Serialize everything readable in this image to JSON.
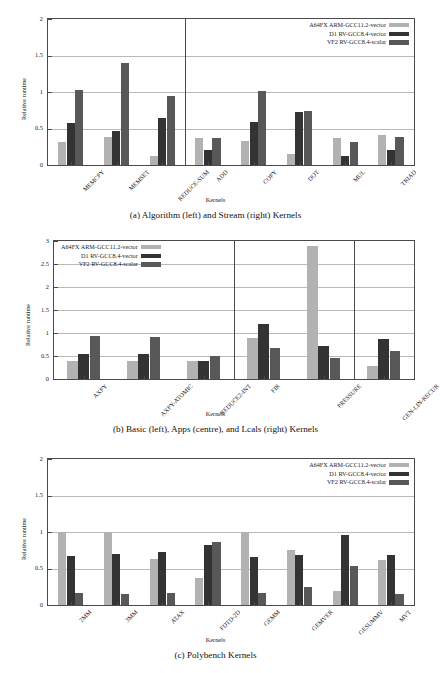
{
  "series_colors": {
    "a64fx": "#b2b2b2",
    "d1": "#333333",
    "vf2": "#585858"
  },
  "legend": {
    "items": [
      {
        "label": "A64FX ARM-GCC11.2-vector",
        "key": "a64fx"
      },
      {
        "label": "D1 RV-GCC8.4-vector",
        "key": "d1"
      },
      {
        "label": "VF2 RV-GCC8.4-scalar",
        "key": "vf2"
      }
    ]
  },
  "axis": {
    "ylabel": "Relative runtime",
    "xlabel": "Kernels"
  },
  "captions": {
    "a": "(a) Algorithm (left) and Stream (right) Kernels",
    "b": "(b) Basic (left), Apps (centre), and Lcals (right) Kernels",
    "c": "(c) Polybench Kernels"
  },
  "chart_data": [
    {
      "id": "a",
      "type": "bar",
      "title": "(a) Algorithm (left) and Stream (right) Kernels",
      "xlabel": "Kernels",
      "ylabel": "Relative runtime",
      "ylim": [
        0,
        2
      ],
      "yticks": [
        0,
        0.5,
        1,
        1.5,
        2
      ],
      "ytick_labels": [
        "0",
        "0.5",
        "1",
        "1.5",
        "2"
      ],
      "grid": true,
      "legend_position": "top-right",
      "group_dividers_after": [
        "REDUCE-SUM"
      ],
      "categories": [
        "MEMCPY",
        "MEMSET",
        "REDUCE-SUM",
        "ADD",
        "COPY",
        "DOT",
        "MUL",
        "TRIAD"
      ],
      "series": [
        {
          "name": "A64FX ARM-GCC11.2-vector",
          "values": [
            0.32,
            0.38,
            0.13,
            0.37,
            0.33,
            0.15,
            0.37,
            0.41
          ]
        },
        {
          "name": "D1 RV-GCC8.4-vector",
          "values": [
            0.58,
            0.47,
            0.65,
            0.21,
            0.59,
            0.72,
            0.13,
            0.21
          ]
        },
        {
          "name": "VF2 RV-GCC8.4-scalar",
          "values": [
            1.03,
            1.4,
            0.95,
            0.37,
            1.02,
            0.74,
            0.31,
            0.39
          ]
        }
      ]
    },
    {
      "id": "b",
      "type": "bar",
      "title": "(b) Basic (left), Apps (centre), and Lcals (right) Kernels",
      "xlabel": "Kernels",
      "ylabel": "Relative runtime",
      "ylim": [
        0,
        3
      ],
      "yticks": [
        0,
        0.5,
        1,
        1.5,
        2,
        2.5,
        3
      ],
      "ytick_labels": [
        "0",
        "0.5",
        "1",
        "1.5",
        "2",
        "2.5",
        "3"
      ],
      "grid": true,
      "legend_position": "top-left",
      "group_dividers_after": [
        "REDUCE2-INT",
        "PRESSURE"
      ],
      "categories": [
        "AXPY",
        "AXPY-ATOMIC",
        "REDUCE2-INT",
        "FIR",
        "PRESSURE",
        "GEN-LIN-RECUR"
      ],
      "series": [
        {
          "name": "A64FX ARM-GCC11.2-vector",
          "values": [
            0.39,
            0.39,
            0.4,
            0.9,
            2.9,
            0.29
          ]
        },
        {
          "name": "D1 RV-GCC8.4-vector",
          "values": [
            0.55,
            0.55,
            0.4,
            1.19,
            0.72,
            0.88
          ]
        },
        {
          "name": "VF2 RV-GCC8.4-scalar",
          "values": [
            0.94,
            0.92,
            0.51,
            0.67,
            0.45,
            0.61
          ]
        }
      ]
    },
    {
      "id": "c",
      "type": "bar",
      "title": "(c) Polybench Kernels",
      "xlabel": "Kernels",
      "ylabel": "Relative runtime",
      "ylim": [
        0,
        2
      ],
      "yticks": [
        0,
        0.5,
        1,
        1.5,
        2
      ],
      "ytick_labels": [
        "0",
        "0.5",
        "1",
        "1.5",
        "2"
      ],
      "grid": true,
      "legend_position": "top-right",
      "group_dividers_after": [],
      "categories": [
        "2MM",
        "3MM",
        "ATAX",
        "FDTD-2D",
        "GEMM",
        "GEMVER",
        "GESUMMV",
        "MVT"
      ],
      "series": [
        {
          "name": "A64FX ARM-GCC11.2-vector",
          "values": [
            1.0,
            1.0,
            0.63,
            0.37,
            1.0,
            0.76,
            0.19,
            0.61
          ]
        },
        {
          "name": "D1 RV-GCC8.4-vector",
          "values": [
            0.67,
            0.7,
            0.72,
            0.82,
            0.66,
            0.69,
            0.96,
            0.69
          ]
        },
        {
          "name": "VF2 RV-GCC8.4-scalar",
          "values": [
            0.16,
            0.15,
            0.17,
            0.86,
            0.17,
            0.24,
            0.54,
            0.15
          ]
        }
      ]
    }
  ]
}
